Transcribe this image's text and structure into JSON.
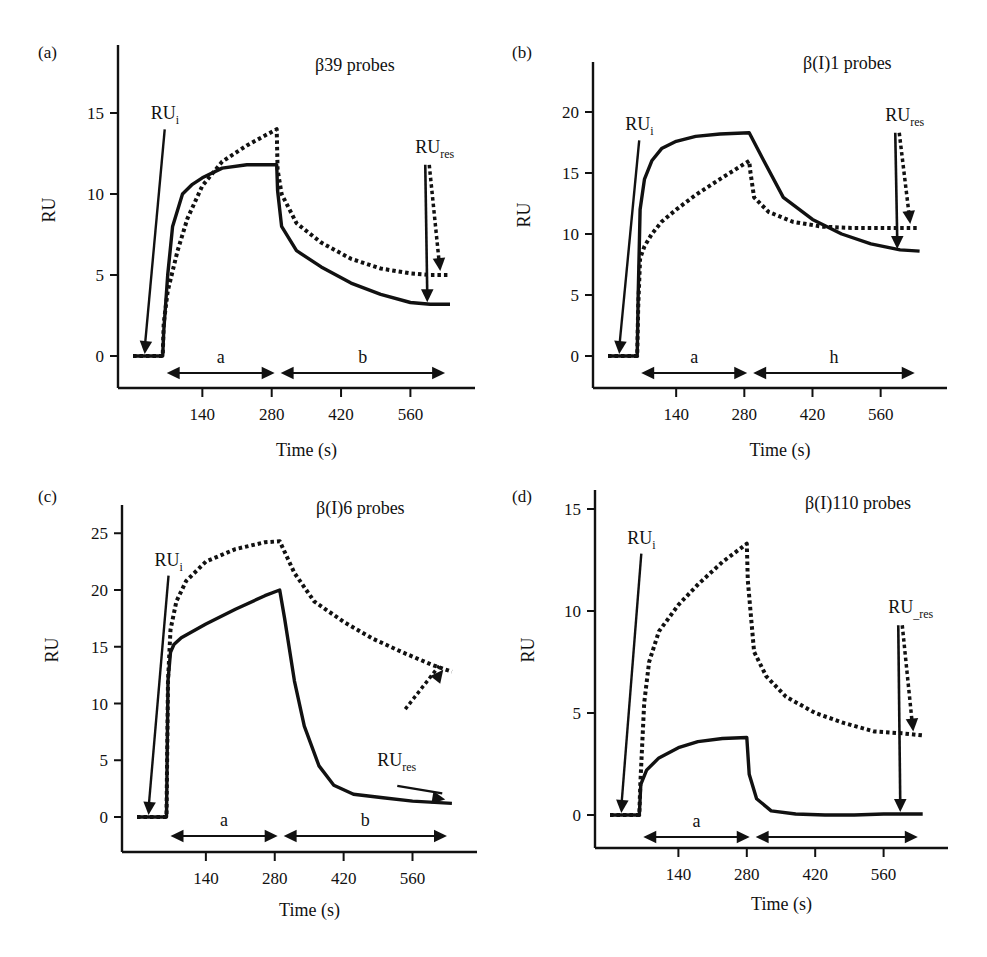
{
  "figure": {
    "panels": [
      {
        "label": "(a)",
        "title": "β39 probes",
        "xlabel": "Time (s)",
        "ylabel": "RU",
        "yticks": [
          0,
          5,
          10,
          15
        ],
        "xticks": [
          140,
          280,
          420,
          560
        ],
        "annot_i": "RU",
        "annot_i_sub": "i",
        "annot_res": "RU",
        "annot_res_sub": "res",
        "phase_a": "a",
        "phase_b": "b"
      },
      {
        "label": "(b)",
        "title": "β(I)1 probes",
        "xlabel": "Time (s)",
        "ylabel": "RU",
        "yticks": [
          0,
          5,
          10,
          15,
          20
        ],
        "xticks": [
          140,
          280,
          420,
          560
        ],
        "annot_i": "RU",
        "annot_i_sub": "i",
        "annot_res": "RU",
        "annot_res_sub": "res",
        "phase_a": "a",
        "phase_b": "h"
      },
      {
        "label": "(c)",
        "title": "β(I)6 probes",
        "xlabel": "Time (s)",
        "ylabel": "RU",
        "yticks": [
          0,
          5,
          10,
          15,
          20,
          25
        ],
        "xticks": [
          140,
          280,
          420,
          560
        ],
        "annot_i": "RU",
        "annot_i_sub": "i",
        "annot_res": "RU",
        "annot_res_sub": "res",
        "phase_a": "a",
        "phase_b": "b"
      },
      {
        "label": "(d)",
        "title": "β(I)110 probes",
        "xlabel": "Time (s)",
        "ylabel": "RU",
        "yticks": [
          0,
          5,
          10,
          15
        ],
        "xticks": [
          140,
          280,
          420,
          560
        ],
        "annot_i": "RU",
        "annot_i_sub": "i",
        "annot_res": "RU",
        "annot_res_sub": "_res",
        "phase_a": "a",
        "phase_b": ""
      }
    ]
  },
  "chart_data": [
    {
      "type": "line",
      "title": "β39 probes",
      "panel": "(a)",
      "xlabel": "Time (s)",
      "ylabel": "RU",
      "xlim": [
        0,
        640
      ],
      "ylim": [
        -2,
        18
      ],
      "xticks": [
        140,
        280,
        420,
        560
      ],
      "yticks": [
        0,
        5,
        10,
        15
      ],
      "grid": false,
      "series": [
        {
          "name": "solid",
          "style": "solid",
          "x": [
            0,
            60,
            62,
            70,
            80,
            100,
            120,
            140,
            180,
            230,
            290,
            292,
            300,
            330,
            380,
            440,
            500,
            560,
            600,
            640
          ],
          "y": [
            0,
            0,
            1.5,
            5,
            8,
            10.0,
            10.6,
            11.0,
            11.6,
            11.8,
            11.8,
            10.2,
            8.0,
            6.5,
            5.5,
            4.5,
            3.8,
            3.3,
            3.2,
            3.2
          ]
        },
        {
          "name": "dotted",
          "style": "dotted",
          "x": [
            0,
            60,
            62,
            70,
            90,
            110,
            140,
            180,
            230,
            290,
            292,
            300,
            330,
            380,
            440,
            500,
            560,
            600,
            640
          ],
          "y": [
            0,
            0,
            2,
            4,
            6.5,
            8.5,
            10.5,
            12.0,
            13.0,
            14.0,
            11.5,
            10.0,
            8.2,
            7.0,
            6.0,
            5.4,
            5.1,
            5.0,
            5.0
          ]
        }
      ],
      "annotations": [
        "RUi",
        "RUres",
        "a",
        "b"
      ]
    },
    {
      "type": "line",
      "title": "β(I)1 probes",
      "panel": "(b)",
      "xlabel": "Time (s)",
      "ylabel": "RU",
      "xlim": [
        0,
        640
      ],
      "ylim": [
        -3,
        23
      ],
      "xticks": [
        140,
        280,
        420,
        560
      ],
      "yticks": [
        0,
        5,
        10,
        15,
        20
      ],
      "grid": false,
      "series": [
        {
          "name": "solid",
          "style": "solid",
          "x": [
            0,
            60,
            62,
            66,
            75,
            90,
            110,
            140,
            180,
            230,
            290,
            320,
            360,
            420,
            480,
            540,
            600,
            640
          ],
          "y": [
            0,
            0,
            5,
            12,
            14.5,
            16.0,
            17.0,
            17.6,
            18.0,
            18.2,
            18.3,
            16.0,
            13.0,
            11.2,
            10.0,
            9.2,
            8.7,
            8.6
          ]
        },
        {
          "name": "dotted",
          "style": "dotted",
          "x": [
            0,
            60,
            62,
            66,
            75,
            90,
            110,
            140,
            180,
            230,
            290,
            292,
            300,
            330,
            380,
            440,
            500,
            560,
            640
          ],
          "y": [
            0,
            0,
            4,
            8,
            9.0,
            10.0,
            11.0,
            12.0,
            13.2,
            14.5,
            16.0,
            15.2,
            13.0,
            11.8,
            11.0,
            10.6,
            10.5,
            10.5,
            10.5
          ]
        }
      ],
      "annotations": [
        "RUi",
        "RUres",
        "a",
        "h"
      ]
    },
    {
      "type": "line",
      "title": "β(I)6 probes",
      "panel": "(c)",
      "xlabel": "Time (s)",
      "ylabel": "RU",
      "xlim": [
        0,
        640
      ],
      "ylim": [
        -3,
        27
      ],
      "xticks": [
        140,
        280,
        420,
        560
      ],
      "yticks": [
        0,
        5,
        10,
        15,
        20,
        25
      ],
      "grid": false,
      "series": [
        {
          "name": "solid",
          "style": "solid",
          "x": [
            0,
            60,
            63,
            68,
            75,
            90,
            140,
            200,
            260,
            290,
            300,
            320,
            340,
            370,
            400,
            440,
            500,
            560,
            640
          ],
          "y": [
            0,
            0,
            12,
            14.5,
            15.2,
            15.8,
            17.0,
            18.3,
            19.5,
            20.0,
            17.5,
            12.0,
            8.0,
            4.5,
            2.8,
            2.0,
            1.7,
            1.4,
            1.2
          ]
        },
        {
          "name": "dotted",
          "style": "dotted",
          "x": [
            0,
            60,
            63,
            68,
            80,
            100,
            140,
            200,
            260,
            290,
            320,
            360,
            420,
            480,
            540,
            600,
            640
          ],
          "y": [
            0,
            0,
            12,
            16.5,
            19.0,
            20.8,
            22.5,
            23.6,
            24.2,
            24.3,
            21.5,
            19.0,
            17.2,
            15.7,
            14.5,
            13.4,
            12.8
          ]
        }
      ],
      "annotations": [
        "RUi",
        "RUres",
        "a",
        "b"
      ]
    },
    {
      "type": "line",
      "title": "β(I)110 probes",
      "panel": "(d)",
      "xlabel": "Time (s)",
      "ylabel": "RU",
      "xlim": [
        0,
        640
      ],
      "ylim": [
        -1.5,
        16
      ],
      "xticks": [
        140,
        280,
        420,
        560
      ],
      "yticks": [
        0,
        5,
        10,
        15
      ],
      "grid": false,
      "series": [
        {
          "name": "solid",
          "style": "solid",
          "x": [
            0,
            60,
            63,
            75,
            100,
            140,
            180,
            230,
            280,
            285,
            300,
            330,
            380,
            440,
            500,
            560,
            640
          ],
          "y": [
            0,
            0,
            1.5,
            2.2,
            2.8,
            3.3,
            3.6,
            3.75,
            3.8,
            2.0,
            0.8,
            0.2,
            0.05,
            0.0,
            0.0,
            0.05,
            0.05
          ]
        },
        {
          "name": "dotted",
          "style": "dotted",
          "x": [
            0,
            60,
            62,
            70,
            80,
            100,
            140,
            180,
            230,
            280,
            282,
            295,
            320,
            360,
            420,
            480,
            540,
            600,
            640
          ],
          "y": [
            0,
            0,
            1.5,
            5.5,
            7.5,
            9.0,
            10.3,
            11.3,
            12.4,
            13.3,
            11.5,
            8.0,
            6.8,
            5.8,
            5.0,
            4.5,
            4.1,
            4.0,
            3.9
          ]
        }
      ],
      "annotations": [
        "RUi",
        "RUres",
        "a"
      ]
    }
  ]
}
